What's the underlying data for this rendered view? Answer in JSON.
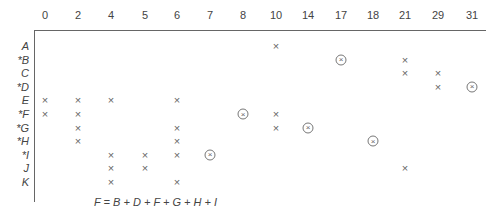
{
  "chart_data": {
    "type": "table",
    "columns": [
      "0",
      "2",
      "4",
      "5",
      "6",
      "7",
      "8",
      "10",
      "14",
      "17",
      "18",
      "21",
      "29",
      "31"
    ],
    "rows": [
      {
        "label": "A",
        "starred": false,
        "x": [
          "10"
        ],
        "circled": []
      },
      {
        "label": "B",
        "starred": true,
        "x": [
          "21"
        ],
        "circled": [
          "17"
        ]
      },
      {
        "label": "C",
        "starred": false,
        "x": [
          "21",
          "29"
        ],
        "circled": []
      },
      {
        "label": "D",
        "starred": true,
        "x": [
          "29"
        ],
        "circled": [
          "31"
        ]
      },
      {
        "label": "E",
        "starred": false,
        "x": [
          "0",
          "2",
          "4",
          "6"
        ],
        "circled": []
      },
      {
        "label": "F",
        "starred": true,
        "x": [
          "0",
          "2",
          "10"
        ],
        "circled": [
          "8"
        ]
      },
      {
        "label": "G",
        "starred": true,
        "x": [
          "2",
          "6",
          "10"
        ],
        "circled": [
          "14"
        ]
      },
      {
        "label": "H",
        "starred": true,
        "x": [
          "2",
          "6"
        ],
        "circled": [
          "18"
        ]
      },
      {
        "label": "I",
        "starred": true,
        "x": [
          "4",
          "5",
          "6"
        ],
        "circled": [
          "7"
        ]
      },
      {
        "label": "J",
        "starred": false,
        "x": [
          "4",
          "5",
          "21"
        ],
        "circled": []
      },
      {
        "label": "K",
        "starred": false,
        "x": [
          "4",
          "6"
        ],
        "circled": []
      }
    ],
    "formula": "F = B + D + F + G + H + I"
  },
  "symbols": {
    "x_mark": "×",
    "circled_mark": "⊗"
  }
}
